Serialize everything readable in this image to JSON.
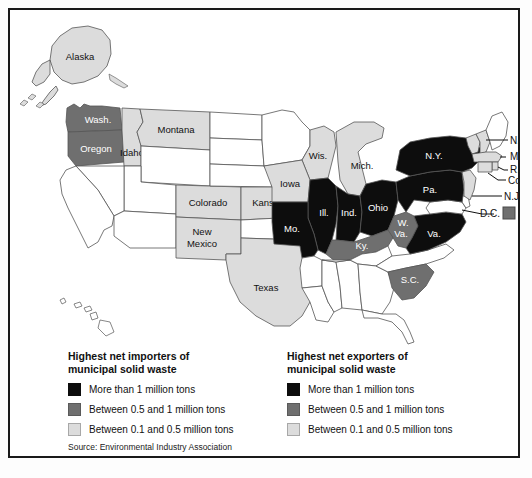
{
  "figure": {
    "source": "Source: Environmental Industry Association"
  },
  "legend": {
    "importers": {
      "heading": "Highest net importers of\nmunicipal solid waste",
      "items": [
        {
          "label": "More than 1 million tons",
          "color": "#0d0d0d",
          "level": "high"
        },
        {
          "label": "Between 0.5 and 1 million tons",
          "color": "#6f6f6f",
          "level": "mid"
        },
        {
          "label": "Between 0.1 and 0.5 million tons",
          "color": "#dcdcdc",
          "level": "low"
        }
      ]
    },
    "exporters": {
      "heading": "Highest net exporters of\nmunicipal solid waste",
      "items": [
        {
          "label": "More than 1 million tons",
          "color": "#0d0d0d",
          "level": "high"
        },
        {
          "label": "Between 0.5 and 1 million tons",
          "color": "#6f6f6f",
          "level": "mid"
        },
        {
          "label": "Between 0.1 and 0.5 million tons",
          "color": "#dcdcdc",
          "level": "low"
        }
      ]
    }
  },
  "colors": {
    "high": "#0d0d0d",
    "mid": "#6f6f6f",
    "low": "#dcdcdc",
    "none": "#ffffff",
    "outline": "#555555",
    "frame": "#1a1a1a",
    "text": "#111111",
    "text_on_dark": "#ffffff"
  },
  "map": {
    "labels": {
      "alaska": "Alaska",
      "washington": "Wash.",
      "oregon": "Oregon",
      "idaho": "Idaho",
      "montana": "Montana",
      "colorado": "Colorado",
      "kansas": "Kansas",
      "new_mexico": "New Mexico",
      "texas": "Texas",
      "wisconsin": "Wis.",
      "michigan": "Mich.",
      "iowa": "Iowa",
      "illinois": "Ill.",
      "indiana": "Ind.",
      "ohio": "Ohio",
      "missouri": "Mo.",
      "kentucky": "Ky.",
      "pennsylvania": "Pa.",
      "new_york": "N.Y.",
      "west_virginia": "W.\nVa.",
      "virginia": "Va.",
      "south_carolina": "S.C.",
      "new_hampshire": "N.H.",
      "massachusetts": "Mass.",
      "rhode_island": "R.I.",
      "connecticut": "Conn.",
      "new_jersey": "N.J.",
      "district_of_columbia": "D.C."
    },
    "state_levels": {
      "alaska": "low",
      "washington": "mid",
      "oregon": "mid",
      "idaho": "low",
      "montana": "low",
      "colorado": "low",
      "kansas": "low",
      "new_mexico": "low",
      "texas": "low",
      "wisconsin": "low",
      "michigan": "low",
      "iowa": "low",
      "illinois": "high",
      "indiana": "high",
      "ohio": "high",
      "missouri": "high",
      "kentucky": "mid",
      "pennsylvania": "high",
      "new_york": "high",
      "west_virginia": "mid",
      "virginia": "high",
      "south_carolina": "mid",
      "new_hampshire": "low",
      "massachusetts": "low",
      "rhode_island": "low",
      "connecticut": "low",
      "new_jersey": "low",
      "district_of_columbia": "mid",
      "california": "none",
      "nevada": "none",
      "arizona": "none",
      "utah": "none",
      "wyoming": "none",
      "north_dakota": "none",
      "south_dakota": "none",
      "nebraska": "none",
      "minnesota": "none",
      "oklahoma": "none",
      "arkansas": "none",
      "louisiana": "none",
      "mississippi": "none",
      "alabama": "none",
      "tennessee": "none",
      "georgia": "none",
      "florida": "none",
      "north_carolina": "none",
      "maine": "none",
      "vermont": "none",
      "delaware": "none",
      "maryland": "none",
      "hawaii": "none"
    }
  }
}
